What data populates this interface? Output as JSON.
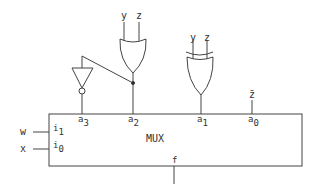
{
  "diagram": {
    "mux": {
      "label": "MUX",
      "inputs": [
        {
          "signal": "w",
          "pin": "i",
          "sub": "1"
        },
        {
          "signal": "x",
          "pin": "i",
          "sub": "0"
        }
      ],
      "selects": [
        {
          "pin": "a",
          "sub": "3"
        },
        {
          "pin": "a",
          "sub": "2"
        },
        {
          "pin": "a",
          "sub": "1"
        },
        {
          "pin": "a",
          "sub": "0"
        }
      ],
      "output": "f"
    },
    "gates": {
      "or_gate": {
        "inputs": [
          "y",
          "z"
        ],
        "drives": "a2"
      },
      "xor_gate": {
        "inputs": [
          "y",
          "z"
        ],
        "drives": "a1"
      },
      "inverter": {
        "input_from": "or_gate output",
        "drives": "a3"
      }
    },
    "a0_signal": "z̄"
  }
}
